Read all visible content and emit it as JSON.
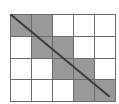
{
  "figure": {
    "kind": "shaded-grid-with-diagonal",
    "colors": {
      "shaded_cell": "#999999",
      "empty_cell": "#ffffff",
      "grid_line": "#6b6b6b",
      "diagonal_line": "#3c3c3c",
      "background": "#ffffff"
    }
  },
  "grid": {
    "columns": 5,
    "rows": 4,
    "cell_width_px": 20,
    "cell_height_px": 20.75,
    "origin_x_px": 10,
    "origin_y_px": 14,
    "total_cells": 20,
    "shaded_count": 8,
    "empty_count": 12,
    "rows_data": [
      {
        "row_index": 1,
        "cells": [
          {
            "col": 1,
            "state": "shaded"
          },
          {
            "col": 2,
            "state": "shaded"
          },
          {
            "col": 3,
            "state": "empty"
          },
          {
            "col": 4,
            "state": "empty"
          },
          {
            "col": 5,
            "state": "empty"
          }
        ]
      },
      {
        "row_index": 2,
        "cells": [
          {
            "col": 1,
            "state": "empty"
          },
          {
            "col": 2,
            "state": "shaded"
          },
          {
            "col": 3,
            "state": "shaded"
          },
          {
            "col": 4,
            "state": "empty"
          },
          {
            "col": 5,
            "state": "empty"
          }
        ]
      },
      {
        "row_index": 3,
        "cells": [
          {
            "col": 1,
            "state": "empty"
          },
          {
            "col": 2,
            "state": "empty"
          },
          {
            "col": 3,
            "state": "shaded"
          },
          {
            "col": 4,
            "state": "shaded"
          },
          {
            "col": 5,
            "state": "empty"
          }
        ]
      },
      {
        "row_index": 4,
        "cells": [
          {
            "col": 1,
            "state": "empty"
          },
          {
            "col": 2,
            "state": "empty"
          },
          {
            "col": 3,
            "state": "empty"
          },
          {
            "col": 4,
            "state": "shaded"
          },
          {
            "col": 5,
            "state": "shaded"
          }
        ]
      }
    ]
  },
  "diagonal": {
    "from": {
      "x": 0,
      "y": 0
    },
    "to": {
      "x": 100,
      "y": 83
    },
    "stroke": "#3c3c3c",
    "stroke_width": 2
  }
}
